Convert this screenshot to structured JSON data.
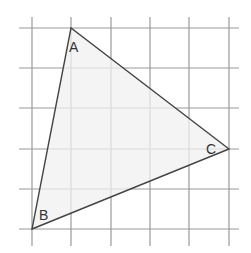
{
  "diagram": {
    "type": "triangle-on-grid",
    "grid": {
      "x_lines": [
        32,
        71,
        111,
        150,
        189,
        229
      ],
      "y_lines": [
        28,
        68,
        108,
        149,
        189,
        229
      ],
      "x_extent": [
        19,
        239
      ],
      "y_extent": [
        17,
        246
      ],
      "color": "#9a9a9a"
    },
    "triangle": {
      "fill": "#f0f0f0",
      "stroke": "#444444",
      "vertices": [
        {
          "name": "A",
          "x": 71,
          "y": 28,
          "label_x": 69,
          "label_y": 52
        },
        {
          "name": "B",
          "x": 32,
          "y": 229,
          "label_x": 39,
          "label_y": 220
        },
        {
          "name": "C",
          "x": 229,
          "y": 149,
          "label_x": 206,
          "label_y": 154
        }
      ]
    }
  }
}
